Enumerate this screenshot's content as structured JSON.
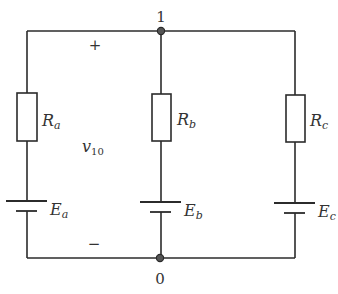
{
  "diagram": {
    "type": "circuit",
    "nodes": {
      "top": {
        "label": "1"
      },
      "bottom": {
        "label": "0"
      }
    },
    "voltage": {
      "name": "v",
      "subscript": "10",
      "plus": "+",
      "minus": "−"
    },
    "branches": [
      {
        "resistor": {
          "name": "R",
          "sub": "a"
        },
        "source": {
          "name": "E",
          "sub": "a"
        }
      },
      {
        "resistor": {
          "name": "R",
          "sub": "b"
        },
        "source": {
          "name": "E",
          "sub": "b"
        }
      },
      {
        "resistor": {
          "name": "R",
          "sub": "c"
        },
        "source": {
          "name": "E",
          "sub": "c"
        }
      }
    ],
    "colors": {
      "line": "#2b2b2b",
      "node_fill": "#555555",
      "text": "#333333"
    }
  }
}
